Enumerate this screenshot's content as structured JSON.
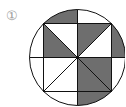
{
  "figure": {
    "label": "①",
    "colors": {
      "shade": "#6e6e6e",
      "line": "#111111",
      "background": "#ffffff",
      "label": "#9a9a9a"
    },
    "circle": {
      "cx": 77.5,
      "cy": 57.5,
      "r": 48
    },
    "square_half_side": 34,
    "shaded_regions": [
      "top-segment-left",
      "top-left-quadrant-left-triangle",
      "top-right-quadrant-upper-triangle",
      "right-segment-upper",
      "bottom-right-quadrant-both-triangles",
      "bottom-segment-right"
    ]
  }
}
